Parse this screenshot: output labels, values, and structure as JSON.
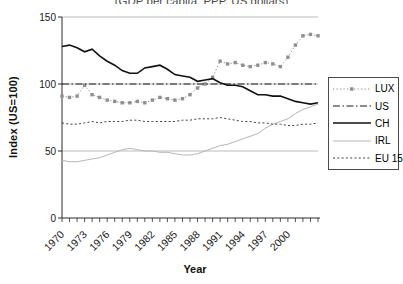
{
  "partial_title": "(GDP per capita, PPP, US dollars)",
  "y_axis_title": "Index (US=100)",
  "x_axis_title": "Year",
  "legend": {
    "labels": [
      "LUX",
      "US",
      "CH",
      "IRL",
      "EU 15"
    ]
  },
  "chart_data": {
    "type": "line",
    "title": "",
    "xlabel": "Year",
    "ylabel": "Index (US=100)",
    "x_min": 1970,
    "x_max": 2004,
    "ylim": [
      0,
      150
    ],
    "yticks": [
      0,
      50,
      100,
      150
    ],
    "ytick_labels": [
      "0",
      "50",
      "100",
      "150"
    ],
    "x_tick_years": [
      1970,
      1973,
      1976,
      1979,
      1982,
      1985,
      1988,
      1991,
      1994,
      1997,
      2000
    ],
    "x_tick_labels": [
      "1970",
      "1973",
      "1976",
      "1979",
      "1982",
      "1985",
      "1988",
      "1991",
      "1994",
      "1997",
      "2000"
    ],
    "grid": true,
    "grid_color": "#b3b3b3",
    "axis_color": "#2b2b2b",
    "legend_position": "right-outside",
    "years": [
      1970,
      1971,
      1972,
      1973,
      1974,
      1975,
      1976,
      1977,
      1978,
      1979,
      1980,
      1981,
      1982,
      1983,
      1984,
      1985,
      1986,
      1987,
      1988,
      1989,
      1990,
      1991,
      1992,
      1993,
      1994,
      1995,
      1996,
      1997,
      1998,
      1999,
      2000,
      2001,
      2002,
      2003,
      2004
    ],
    "series": [
      {
        "name": "LUX",
        "color": "#8f8f8f",
        "dash": "1.3 2.2",
        "width": 1,
        "marker": "square",
        "marker_size": 3.4,
        "values": [
          91,
          90,
          91,
          99,
          92,
          90,
          88,
          87,
          86,
          86,
          87,
          86,
          88,
          90,
          89,
          88,
          89,
          92,
          97,
          100,
          105,
          117,
          115,
          116,
          114,
          113,
          114,
          116,
          115,
          113,
          120,
          129,
          136,
          137,
          136
        ]
      },
      {
        "name": "US",
        "color": "#1a1a1a",
        "dash": "7 2.5 1.5 2.5",
        "width": 1.1,
        "marker": null,
        "values": [
          100,
          100,
          100,
          100,
          100,
          100,
          100,
          100,
          100,
          100,
          100,
          100,
          100,
          100,
          100,
          100,
          100,
          100,
          100,
          100,
          100,
          100,
          100,
          100,
          100,
          100,
          100,
          100,
          100,
          100,
          100,
          100,
          100,
          100,
          100
        ]
      },
      {
        "name": "CH",
        "color": "#111111",
        "dash": null,
        "width": 1.6,
        "marker": null,
        "values": [
          128,
          129,
          127,
          124,
          126,
          121,
          117,
          114,
          110,
          108,
          108,
          112,
          113,
          114,
          111,
          107,
          106,
          105,
          102,
          103,
          104,
          101,
          99,
          99,
          98,
          95,
          92,
          92,
          91,
          91,
          89,
          87,
          86,
          85,
          86
        ]
      },
      {
        "name": "IRL",
        "color": "#b5b5b5",
        "dash": null,
        "width": 1,
        "marker": null,
        "values": [
          43,
          42,
          42,
          43,
          44,
          45,
          47,
          49,
          51,
          52,
          51,
          50,
          50,
          49,
          49,
          48,
          47,
          47,
          48,
          50,
          52,
          54,
          55,
          57,
          59,
          61,
          63,
          67,
          70,
          72,
          74,
          78,
          81,
          83,
          85
        ]
      },
      {
        "name": "EU 15",
        "color": "#3f3f3f",
        "dash": "2 2.3",
        "width": 1,
        "marker": null,
        "values": [
          71,
          70,
          70,
          71,
          72,
          71,
          72,
          72,
          72,
          73,
          73,
          72,
          72,
          72,
          72,
          72,
          73,
          73,
          74,
          74,
          74,
          75,
          74,
          73,
          72,
          72,
          71,
          71,
          70,
          70,
          69,
          69,
          70,
          70,
          71
        ]
      }
    ]
  }
}
